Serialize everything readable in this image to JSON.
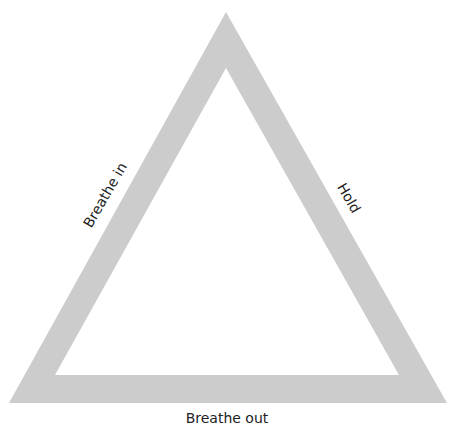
{
  "diagram": {
    "type": "breathing-triangle",
    "colors": {
      "triangle_fill": "#cccccc",
      "background": "#ffffff",
      "text": "#222222"
    },
    "outer_triangle": {
      "apex": [
        226,
        12
      ],
      "bottom_left": [
        9,
        403
      ],
      "bottom_right": [
        447,
        403
      ]
    },
    "inner_triangle": {
      "apex": [
        226,
        68
      ],
      "bottom_left": [
        55,
        375
      ],
      "bottom_right": [
        399,
        375
      ]
    },
    "labels": {
      "left_side": "Breathe in",
      "right_side": "Hold",
      "bottom_side": "Breathe out"
    }
  }
}
